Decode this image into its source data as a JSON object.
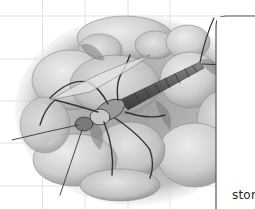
{
  "illustration": {
    "subject": "stonefly nymph on pebbles",
    "style": "grayscale pencil illustration",
    "icon": "stonefly-nymph-illustration"
  },
  "callout": {
    "label_partial": "ston"
  },
  "grid": {
    "line_color": "#dcdcdc",
    "spacing_px": 42.5
  },
  "colors": {
    "background": "#ffffff",
    "callout_line": "#555555",
    "text": "#2a2a2a",
    "pebble_light": "#d6d6d6",
    "pebble_mid": "#b8b8b8",
    "shadow": "#7a7a7a",
    "insect_dark": "#4a4a4a"
  }
}
